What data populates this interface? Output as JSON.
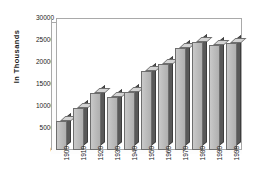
{
  "chart_data": {
    "type": "bar",
    "title": "",
    "xlabel": "",
    "ylabel": "In Thousands",
    "categories": [
      "1900",
      "1910",
      "1920",
      "1930",
      "1940",
      "1950",
      "1960",
      "1970",
      "1980",
      "1990",
      "1998"
    ],
    "values": [
      7000,
      10000,
      13500,
      12700,
      13900,
      18700,
      20500,
      24200,
      25800,
      24900,
      25400
    ],
    "ylim": [
      0,
      30000
    ],
    "yticks": [
      0,
      5000,
      10000,
      15000,
      20000,
      25000,
      30000
    ],
    "ytick_labels": [
      "0",
      "5000",
      "10000",
      "15000",
      "20000",
      "25000",
      "30000"
    ],
    "grid": false,
    "legend": null,
    "style": "3d-column",
    "colors": {
      "bar_front": "#bdbdbd",
      "bar_side": "#595959",
      "bar_top": "#d4d4d4",
      "bar_outline": "#6e6e6e",
      "axis": "#a9a9a9",
      "text": "#1a1a1a",
      "background": "#ffffff"
    }
  }
}
